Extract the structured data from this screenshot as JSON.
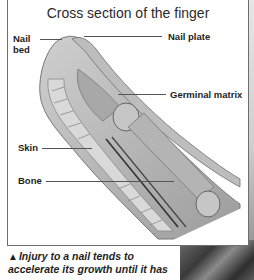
{
  "diagram": {
    "title": "Cross section of the finger",
    "labels": {
      "nail_bed_line1": "Nail",
      "nail_bed_line2": "bed",
      "nail_plate": "Nail plate",
      "germinal_matrix": "Germinal matrix",
      "skin": "Skin",
      "bone": "Bone"
    }
  },
  "caption": {
    "marker": "▲",
    "text": "Injury to a nail tends to accelerate its growth until it has"
  }
}
